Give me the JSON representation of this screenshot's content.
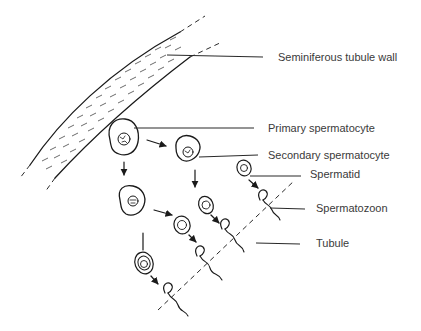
{
  "diagram": {
    "labels": {
      "wall": "Seminiferous tubule wall",
      "primary": "Primary spermatocyte",
      "secondary": "Secondary spermatocyte",
      "spermatid": "Spermatid",
      "spermatozoon": "Spermatozoon",
      "tubule": "Tubule"
    },
    "colors": {
      "ink": "#1a1a1a",
      "text": "#3a3a3a",
      "background": "#ffffff"
    }
  }
}
